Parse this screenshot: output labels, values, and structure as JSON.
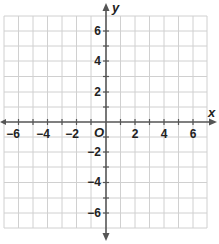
{
  "diagram": {
    "type": "coordinate-plane",
    "x_axis": {
      "label": "x",
      "min": -7,
      "max": 7,
      "tick_step": 1,
      "labeled_ticks": [
        -6,
        -4,
        -2,
        2,
        4,
        6
      ]
    },
    "y_axis": {
      "label": "y",
      "min": -7,
      "max": 7,
      "tick_step": 1,
      "labeled_ticks": [
        6,
        4,
        2,
        -2,
        -4,
        -6
      ]
    },
    "origin_label": "O",
    "labels": {
      "x": {
        "neg6": "−6",
        "neg4": "−4",
        "neg2": "−2",
        "pos2": "2",
        "pos4": "4",
        "pos6": "6"
      },
      "y": {
        "pos6": "6",
        "pos4": "4",
        "pos2": "2",
        "neg2": "−2",
        "neg4": "−4",
        "neg6": "−6"
      }
    },
    "colors": {
      "grid": "#d0d0d0",
      "axis": "#555555",
      "text": "#222222",
      "background": "#ffffff"
    }
  }
}
